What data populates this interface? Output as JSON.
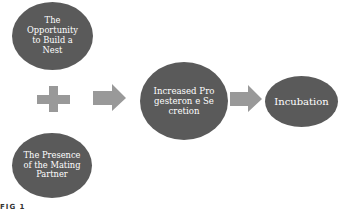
{
  "diagram": {
    "nodes": {
      "nest": {
        "label": "The Opportunity to Build a Nest"
      },
      "partner": {
        "label": "The Presence of the Mating Partner"
      },
      "progesterone": {
        "label": "Increased Progesteron e Secretion"
      },
      "incubation": {
        "label": "Incubation"
      }
    },
    "operator": {
      "symbol": "plus-icon"
    },
    "connectors": [
      {
        "from": "nest+partner",
        "to": "progesterone",
        "icon": "arrow-right-icon"
      },
      {
        "from": "progesterone",
        "to": "incubation",
        "icon": "arrow-right-icon"
      }
    ],
    "colors": {
      "node_fill": "#5a5a5a",
      "node_text": "#ffffff",
      "connector_fill": "#999999"
    },
    "caption_fragment": "FIG 1"
  }
}
